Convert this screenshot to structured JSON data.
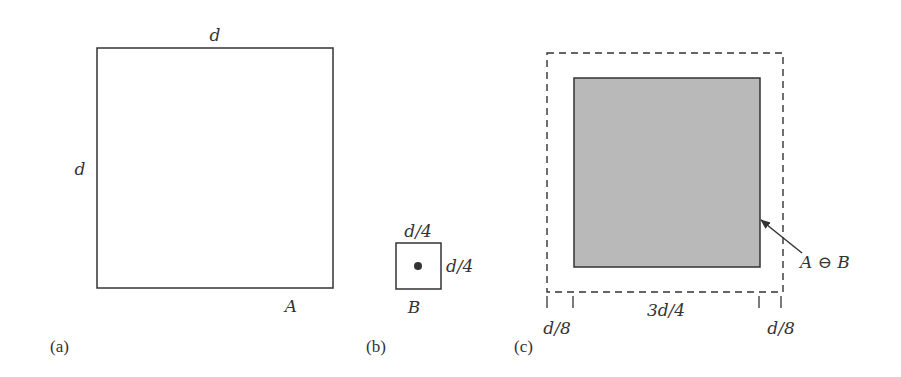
{
  "panels": {
    "a": {
      "caption": "(a)",
      "top_label": "d",
      "side_label": "d",
      "set_label": "A"
    },
    "b": {
      "caption": "(b)",
      "top_label": "d/4",
      "side_label": "d/4",
      "set_label": "B"
    },
    "c": {
      "caption": "(c)",
      "result_label": "A ⊖ B",
      "dim_left": "d/8",
      "dim_middle": "3d/4",
      "dim_right": "d/8"
    }
  },
  "colors": {
    "stroke": "#333333",
    "erosion_fill": "#b9b9b9",
    "background": "#ffffff"
  }
}
